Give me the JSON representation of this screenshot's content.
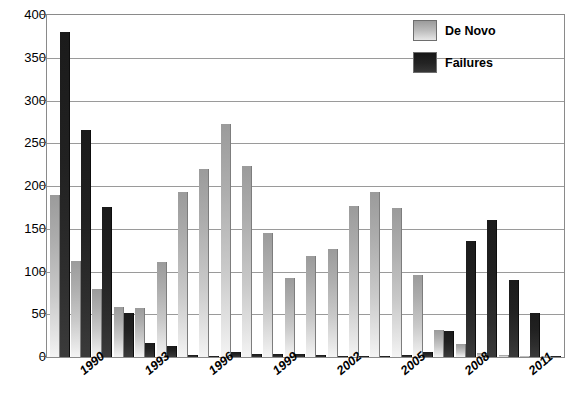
{
  "chart_data": {
    "type": "bar",
    "title": "",
    "xlabel": "",
    "ylabel": "",
    "ylim": [
      0,
      400
    ],
    "y_ticks": [
      0,
      50,
      100,
      150,
      200,
      250,
      300,
      350,
      400
    ],
    "grid": true,
    "legend_position": "top-right",
    "categories": [
      "1989",
      "1990",
      "1991",
      "1992",
      "1993",
      "1994",
      "1995",
      "1996",
      "1997",
      "1998",
      "1999",
      "2000",
      "2001",
      "2002",
      "2003",
      "2004",
      "2005",
      "2006",
      "2007",
      "2008",
      "2009",
      "2010",
      "2011",
      "2012"
    ],
    "visible_tick_labels": [
      "1990",
      "1993",
      "1996",
      "1999",
      "2002",
      "2005",
      "2008",
      "2011"
    ],
    "visible_tick_indices": [
      1,
      4,
      7,
      10,
      13,
      16,
      19,
      22
    ],
    "series": [
      {
        "name": "De Novo",
        "color": "#bcbcbc",
        "values": [
          190,
          112,
          79,
          59,
          57,
          111,
          193,
          220,
          272,
          223,
          145,
          93,
          118,
          126,
          177,
          193,
          174,
          96,
          32,
          15,
          5,
          2,
          1,
          1
        ]
      },
      {
        "name": "Failures",
        "color": "#222222",
        "values": [
          380,
          266,
          175,
          51,
          16,
          13,
          2,
          1,
          6,
          3,
          4,
          3,
          2,
          1,
          1,
          1,
          2,
          6,
          30,
          136,
          160,
          90,
          52,
          1
        ]
      }
    ]
  },
  "legend": {
    "items": [
      {
        "label": "De Novo"
      },
      {
        "label": "Failures"
      }
    ]
  }
}
